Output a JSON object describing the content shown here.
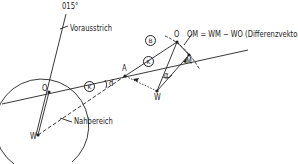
{
  "diagram": {
    "labels": {
      "heading": "015°",
      "heading_line": "Vorausstrich",
      "near_zone": "Nahbereich",
      "point_O_start": "O",
      "point_W_start": "W",
      "point_A": "A",
      "point_O_end": "O",
      "point_M": "M",
      "point_W_end": "W",
      "angle_alpha": "α",
      "angle_d": "d",
      "circle_B": "B",
      "circle_K1": "K",
      "circle_K2": "K",
      "vector_formula": "OM = WM − WO (Differenzvektor)"
    },
    "colors": {
      "line": "#222222",
      "background": "#ffffff"
    }
  }
}
